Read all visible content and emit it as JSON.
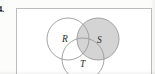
{
  "figure": {
    "item_label": "4.",
    "type": "venn-diagram",
    "caption": "",
    "universal_set_box": true,
    "stroke_color": "#8f8f8f",
    "border_color": "#bcbcbc",
    "background_color": "#ffffff",
    "shade_color": "#d4d4d4",
    "sets": [
      {
        "name": "R",
        "label": "R",
        "position": "left",
        "shaded": false,
        "fill": "#ffffff"
      },
      {
        "name": "S",
        "label": "S",
        "position": "right",
        "shaded": true,
        "fill": "#d4d4d4"
      },
      {
        "name": "T",
        "label": "T",
        "position": "bottom-center",
        "shaded": false,
        "fill": "#ffffff"
      }
    ],
    "shaded_region_description": "Set S shaded entirely"
  }
}
